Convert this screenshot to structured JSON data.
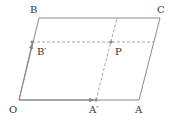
{
  "diagram": {
    "type": "parallelogram-vector-decomposition",
    "colors": {
      "solid": "#888888",
      "dashed": "#999999",
      "label": "#333333",
      "point": "#888888"
    },
    "points": {
      "O": {
        "label": "O",
        "x": 19,
        "y": 100
      },
      "A": {
        "label": "A",
        "x": 139,
        "y": 100
      },
      "B": {
        "label": "B",
        "x": 39,
        "y": 18
      },
      "C": {
        "label": "C",
        "x": 160,
        "y": 18
      },
      "A_prime": {
        "label": "A′",
        "x": 96,
        "y": 100
      },
      "B_prime": {
        "label": "B′",
        "x": 32,
        "y": 42
      },
      "P": {
        "label": "P",
        "x": 111,
        "y": 42
      }
    },
    "edges": [
      {
        "from": "O",
        "to": "A",
        "style": "solid"
      },
      {
        "from": "A",
        "to": "C",
        "style": "solid"
      },
      {
        "from": "C",
        "to": "B",
        "style": "solid"
      },
      {
        "from": "B",
        "to": "O",
        "style": "solid"
      },
      {
        "from": "B_prime",
        "to": "AC_side",
        "style": "dashed"
      },
      {
        "from": "A_prime",
        "to": "BC_side",
        "style": "dashed"
      }
    ],
    "vectors": [
      {
        "from": "O",
        "to": "A_prime",
        "name": "OA′"
      },
      {
        "from": "O",
        "to": "B_prime",
        "name": "OB′"
      }
    ]
  }
}
